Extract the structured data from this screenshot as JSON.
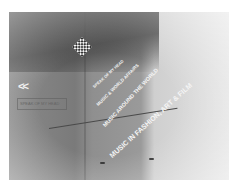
{
  "navigation": {
    "back_label": "<<",
    "label": "SPEAK OF MY HEAD"
  },
  "logo": {
    "icon": "patterned-square-logo"
  },
  "menu": {
    "items": [
      {
        "label": "SPEAK OF MY HEAD"
      },
      {
        "label": "MUSIC & WORLD AFFAIRS"
      },
      {
        "label": "MUSIC AROUND THE WORLD"
      },
      {
        "label": "MUSIC IN FASHION, ART & FILM"
      }
    ]
  },
  "colors": {
    "text": "#f5f5f5",
    "background_dark": "#4a4a4a",
    "background_light": "#e2e2e2"
  }
}
